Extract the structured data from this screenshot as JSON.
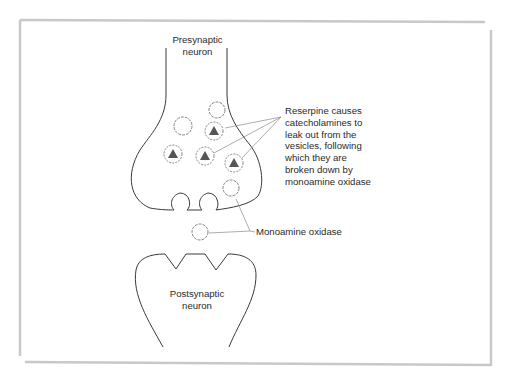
{
  "figure": {
    "frame_color": "#c8c8c8",
    "line_color": "#3a3a3a",
    "connector_color": "#8a8a8a",
    "triangle_color": "#555555"
  },
  "labels": {
    "presynaptic": [
      "Presynaptic",
      "neuron"
    ],
    "postsynaptic": [
      "Postsynaptic",
      "neuron"
    ],
    "reserpine_note": [
      "Reserpine causes",
      "catecholamines to",
      "leak out from the",
      "vesicles, following",
      "which they are",
      "broken down by",
      "monoamine oxidase"
    ],
    "mao": "Monoamine oxidase"
  }
}
